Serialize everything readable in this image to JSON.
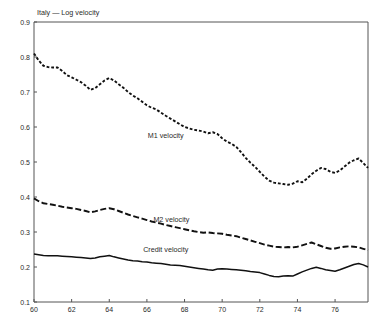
{
  "chart_data": {
    "type": "line",
    "title": "Italy — Log velocity",
    "xlabel": "",
    "ylabel": "",
    "xlim": [
      60,
      77.75
    ],
    "ylim": [
      0.1,
      0.9
    ],
    "grid": false,
    "legend_position": "inline-annotations",
    "x_ticks": [
      "60",
      "62",
      "64",
      "66",
      "68",
      "70",
      "72",
      "74",
      "76"
    ],
    "x_tick_values": [
      60,
      62,
      64,
      66,
      68,
      70,
      72,
      74,
      76
    ],
    "y_ticks": [
      "0.1",
      "0.2",
      "0.3",
      "0.4",
      "0.5",
      "0.6",
      "0.7",
      "0.8",
      "0.9"
    ],
    "y_tick_values": [
      0.1,
      0.2,
      0.3,
      0.4,
      0.5,
      0.6,
      0.7,
      0.8,
      0.9
    ],
    "x": [
      60.0,
      60.25,
      60.5,
      60.75,
      61.0,
      61.25,
      61.5,
      61.75,
      62.0,
      62.25,
      62.5,
      62.75,
      63.0,
      63.25,
      63.5,
      63.75,
      64.0,
      64.25,
      64.5,
      64.75,
      65.0,
      65.25,
      65.5,
      65.75,
      66.0,
      66.25,
      66.5,
      66.75,
      67.0,
      67.25,
      67.5,
      67.75,
      68.0,
      68.25,
      68.5,
      68.75,
      69.0,
      69.25,
      69.5,
      69.75,
      70.0,
      70.25,
      70.5,
      70.75,
      71.0,
      71.25,
      71.5,
      71.75,
      72.0,
      72.25,
      72.5,
      72.75,
      73.0,
      73.25,
      73.5,
      73.75,
      74.0,
      74.25,
      74.5,
      74.75,
      75.0,
      75.25,
      75.5,
      75.75,
      76.0,
      76.25,
      76.5,
      76.75,
      77.0,
      77.25,
      77.5,
      77.75
    ],
    "series": [
      {
        "name": "M1 velocity",
        "style": "dotted",
        "color": "#111111",
        "label_x": 67.0,
        "label_y": 0.568,
        "values": [
          0.81,
          0.79,
          0.775,
          0.771,
          0.77,
          0.77,
          0.76,
          0.748,
          0.742,
          0.735,
          0.728,
          0.718,
          0.706,
          0.711,
          0.722,
          0.733,
          0.74,
          0.733,
          0.722,
          0.712,
          0.7,
          0.69,
          0.682,
          0.672,
          0.662,
          0.655,
          0.65,
          0.641,
          0.632,
          0.624,
          0.616,
          0.608,
          0.6,
          0.596,
          0.592,
          0.59,
          0.587,
          0.582,
          0.585,
          0.58,
          0.568,
          0.558,
          0.552,
          0.543,
          0.528,
          0.512,
          0.498,
          0.486,
          0.472,
          0.458,
          0.447,
          0.441,
          0.439,
          0.437,
          0.435,
          0.438,
          0.445,
          0.442,
          0.452,
          0.465,
          0.475,
          0.483,
          0.48,
          0.472,
          0.469,
          0.476,
          0.487,
          0.498,
          0.505,
          0.51,
          0.497,
          0.483
        ]
      },
      {
        "name": "M2 velocity",
        "style": "dashed",
        "color": "#111111",
        "label_x": 67.3,
        "label_y": 0.33,
        "values": [
          0.396,
          0.388,
          0.382,
          0.38,
          0.378,
          0.375,
          0.372,
          0.37,
          0.368,
          0.366,
          0.363,
          0.36,
          0.356,
          0.359,
          0.363,
          0.366,
          0.368,
          0.365,
          0.36,
          0.355,
          0.35,
          0.346,
          0.342,
          0.338,
          0.334,
          0.33,
          0.327,
          0.324,
          0.32,
          0.317,
          0.314,
          0.311,
          0.308,
          0.305,
          0.302,
          0.3,
          0.298,
          0.299,
          0.297,
          0.296,
          0.295,
          0.292,
          0.29,
          0.288,
          0.284,
          0.28,
          0.276,
          0.272,
          0.268,
          0.264,
          0.261,
          0.258,
          0.257,
          0.256,
          0.257,
          0.256,
          0.258,
          0.262,
          0.266,
          0.27,
          0.265,
          0.26,
          0.255,
          0.252,
          0.253,
          0.256,
          0.258,
          0.259,
          0.258,
          0.256,
          0.252,
          0.248
        ]
      },
      {
        "name": "Credit velocity",
        "style": "solid",
        "color": "#111111",
        "label_x": 67.0,
        "label_y": 0.243,
        "values": [
          0.237,
          0.235,
          0.233,
          0.232,
          0.232,
          0.232,
          0.231,
          0.23,
          0.229,
          0.228,
          0.227,
          0.226,
          0.224,
          0.226,
          0.229,
          0.231,
          0.233,
          0.229,
          0.226,
          0.223,
          0.22,
          0.218,
          0.217,
          0.215,
          0.214,
          0.212,
          0.211,
          0.21,
          0.208,
          0.206,
          0.205,
          0.204,
          0.202,
          0.2,
          0.198,
          0.196,
          0.194,
          0.192,
          0.191,
          0.194,
          0.195,
          0.194,
          0.193,
          0.192,
          0.191,
          0.189,
          0.187,
          0.186,
          0.184,
          0.18,
          0.176,
          0.173,
          0.172,
          0.174,
          0.175,
          0.174,
          0.18,
          0.186,
          0.191,
          0.196,
          0.199,
          0.196,
          0.192,
          0.19,
          0.188,
          0.192,
          0.197,
          0.202,
          0.207,
          0.21,
          0.206,
          0.2
        ]
      }
    ]
  }
}
